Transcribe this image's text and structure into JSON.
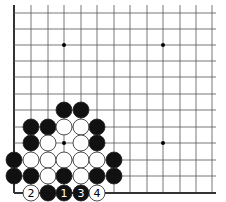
{
  "diagram": {
    "type": "go-board-fragment",
    "grid": {
      "xs": [
        14,
        31,
        48,
        64,
        81,
        97,
        114,
        130,
        147,
        163,
        180,
        196,
        212
      ],
      "ys": [
        13,
        29,
        45,
        61,
        77,
        94,
        110,
        127,
        143,
        160,
        176,
        193
      ],
      "left_edge": true,
      "bottom_edge": true
    },
    "star_points": [
      [
        3,
        2
      ],
      [
        9,
        2
      ],
      [
        3,
        8
      ],
      [
        9,
        8
      ]
    ],
    "stones": [
      {
        "col": 3,
        "row": 6,
        "color": "black"
      },
      {
        "col": 4,
        "row": 6,
        "color": "black"
      },
      {
        "col": 1,
        "row": 7,
        "color": "black"
      },
      {
        "col": 2,
        "row": 7,
        "color": "black"
      },
      {
        "col": 3,
        "row": 7,
        "color": "white"
      },
      {
        "col": 4,
        "row": 7,
        "color": "white"
      },
      {
        "col": 5,
        "row": 7,
        "color": "black"
      },
      {
        "col": 1,
        "row": 8,
        "color": "black"
      },
      {
        "col": 2,
        "row": 8,
        "color": "white"
      },
      {
        "col": 4,
        "row": 8,
        "color": "white"
      },
      {
        "col": 5,
        "row": 8,
        "color": "black"
      },
      {
        "col": 0,
        "row": 9,
        "color": "black"
      },
      {
        "col": 1,
        "row": 9,
        "color": "white"
      },
      {
        "col": 2,
        "row": 9,
        "color": "white"
      },
      {
        "col": 3,
        "row": 9,
        "color": "white"
      },
      {
        "col": 4,
        "row": 9,
        "color": "white"
      },
      {
        "col": 5,
        "row": 9,
        "color": "white"
      },
      {
        "col": 6,
        "row": 9,
        "color": "black"
      },
      {
        "col": 0,
        "row": 10,
        "color": "black"
      },
      {
        "col": 1,
        "row": 10,
        "color": "black"
      },
      {
        "col": 2,
        "row": 10,
        "color": "white"
      },
      {
        "col": 3,
        "row": 10,
        "color": "black"
      },
      {
        "col": 4,
        "row": 10,
        "color": "white"
      },
      {
        "col": 5,
        "row": 10,
        "color": "black"
      },
      {
        "col": 6,
        "row": 10,
        "color": "black"
      },
      {
        "col": 1,
        "row": 11,
        "color": "white",
        "label": "2"
      },
      {
        "col": 2,
        "row": 11,
        "color": "black"
      },
      {
        "col": 3,
        "row": 11,
        "color": "black",
        "label": "1"
      },
      {
        "col": 4,
        "row": 11,
        "color": "black",
        "label": "3"
      },
      {
        "col": 5,
        "row": 11,
        "color": "white",
        "label": "4"
      }
    ],
    "colors": {
      "line": "#555555",
      "edge": "#333333",
      "black": "#111111",
      "white": "#ffffff"
    }
  }
}
